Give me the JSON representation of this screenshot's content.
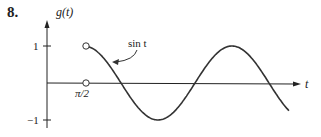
{
  "problem_number": "8.",
  "chart_data": {
    "type": "line",
    "title": "",
    "ylabel": "g(t)",
    "xlabel": "t",
    "yticks": [
      "1",
      "−1"
    ],
    "xticks": [
      "π/2"
    ],
    "annotation": "sin t",
    "series": [
      {
        "name": "sin t",
        "domain": "t > π/2",
        "x_start": 1.5708,
        "x_end": 10.3,
        "open_points": [
          [
            1.5708,
            1
          ],
          [
            1.5708,
            0
          ]
        ]
      }
    ],
    "ylim": [
      -1.2,
      1.3
    ],
    "grid": false
  }
}
